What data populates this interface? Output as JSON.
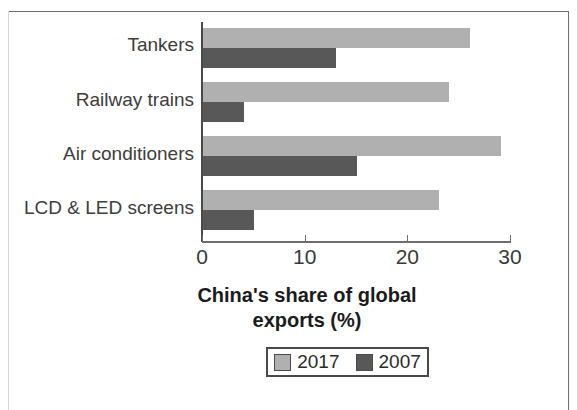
{
  "chart_data": {
    "type": "bar",
    "orientation": "horizontal",
    "title": "",
    "xlabel": "China's share of global exports (%)",
    "ylabel": "",
    "xlim": [
      0,
      30
    ],
    "grid": false,
    "legend_position": "bottom",
    "categories": [
      "Tankers",
      "Railway trains",
      "Air conditioners",
      "LCD & LED screens"
    ],
    "series": [
      {
        "name": "2017",
        "color": "#b0b0b0",
        "values": [
          26,
          24,
          29,
          23
        ]
      },
      {
        "name": "2007",
        "color": "#585858",
        "values": [
          13,
          4,
          15,
          5
        ]
      }
    ],
    "x_ticks": [
      0,
      10,
      20,
      30
    ],
    "x_tick_labels": [
      "0",
      "10",
      "20",
      "30"
    ]
  },
  "axis_title": {
    "line1": "China's share of global",
    "line2": "exports (%)"
  },
  "legend": {
    "entries": [
      {
        "label": "2017",
        "color": "#b0b0b0"
      },
      {
        "label": "2007",
        "color": "#585858"
      }
    ]
  },
  "colors": {
    "series_2017": "#b0b0b0",
    "series_2007": "#585858",
    "axis": "#6e6e6e",
    "text": "#2a2a2a",
    "background": "#ffffff"
  }
}
